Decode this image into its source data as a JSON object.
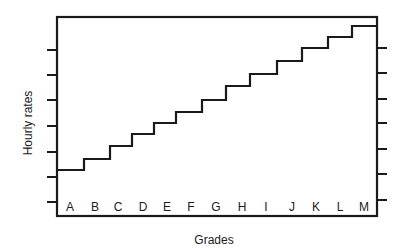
{
  "chart_data": {
    "type": "line",
    "subtype": "step",
    "title": "",
    "xlabel": "Grades",
    "ylabel": "Hourly rates",
    "categories": [
      "A",
      "B",
      "C",
      "D",
      "E",
      "F",
      "G",
      "H",
      "I",
      "J",
      "K",
      "L",
      "M"
    ],
    "values": [
      1.7,
      2.1,
      2.6,
      3.0,
      3.5,
      3.9,
      4.4,
      5.0,
      5.4,
      5.9,
      6.4,
      6.8,
      7.2
    ],
    "y_tick_labels": [],
    "y_ticks_count": 7,
    "ylim": [
      0,
      8
    ],
    "grid": false,
    "legend": null
  },
  "style": {
    "line_color": "#1a1a1a",
    "frame_color": "#1a1a1a"
  },
  "layout_px": {
    "frame": {
      "left": 57,
      "top": 17,
      "right": 377,
      "bottom": 216
    },
    "left_ticks_y": [
      50,
      75,
      100,
      126,
      152,
      177,
      202
    ],
    "right_ticks_y": [
      48,
      73,
      99,
      123,
      149,
      174,
      200
    ],
    "step_levels_y": [
      170,
      159,
      146,
      134,
      123,
      112,
      100,
      86,
      74,
      61,
      48,
      37,
      26
    ],
    "step_edges_x": [
      57,
      84,
      110,
      132,
      154,
      176,
      202,
      226,
      250,
      277,
      302,
      328,
      352,
      377
    ],
    "category_label_x": [
      70,
      95,
      118,
      143,
      167,
      191,
      216,
      242,
      266,
      292,
      316,
      340,
      364
    ]
  }
}
